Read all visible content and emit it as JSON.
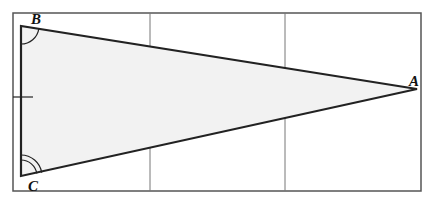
{
  "figure": {
    "type": "triangle-diagram",
    "frame": {
      "x": 13,
      "y": 13,
      "width": 408,
      "height": 178,
      "stroke": "#555555"
    },
    "gridlines_x": [
      150,
      285
    ],
    "triangle": {
      "fill": "#f2f2f2",
      "stroke": "#222222",
      "vertices": {
        "A": {
          "label": "A",
          "x": 417,
          "y": 89
        },
        "B": {
          "label": "B",
          "x": 21,
          "y": 26
        },
        "C": {
          "label": "C",
          "x": 21,
          "y": 176
        }
      }
    },
    "angle_marks": {
      "B": "single-arc",
      "C": "double-arc"
    },
    "tick_marks": [
      {
        "segment": "BC",
        "count": 1,
        "y": 97
      }
    ]
  }
}
